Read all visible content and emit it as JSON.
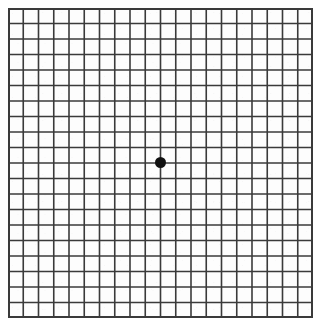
{
  "page": {
    "chart_name": "amsler-grid"
  },
  "chart_data": {
    "type": "table",
    "subtitle": "",
    "xlabel": "",
    "ylabel": "",
    "grid": true,
    "legend_position": "none",
    "columns": 20,
    "rows": 20,
    "cell_size_px": 15.25,
    "categories": [
      "c1",
      "c2",
      "c3",
      "c4",
      "c5",
      "c6",
      "c7",
      "c8",
      "c9",
      "c10",
      "c11",
      "c12",
      "c13",
      "c14",
      "c15",
      "c16",
      "c17",
      "c18",
      "c19",
      "c20"
    ],
    "values": [
      20,
      20,
      20,
      20,
      20,
      20,
      20,
      20,
      20,
      20,
      20,
      20,
      20,
      20,
      20,
      20,
      20,
      20,
      20,
      20
    ],
    "xlim": [
      0,
      20
    ],
    "ylim": [
      0,
      20
    ],
    "annotations": [
      {
        "name": "central-fixation-dot",
        "shape": "filled-circle",
        "x": 10,
        "y": 10,
        "diameter_px": 11
      }
    ]
  },
  "grid": {
    "line_color": "#3a3a3a",
    "line_width_px": 1.6,
    "border_width_px": 2.0,
    "background_color": "#fdfdfd",
    "columns": 20,
    "rows": 20,
    "origin_x_px": 8,
    "origin_y_px": 8,
    "width_px": 305,
    "height_px": 310
  },
  "fixation_dot": {
    "name": "central-fixation-dot",
    "color": "#111111",
    "center_x_px": 160,
    "center_y_px": 162,
    "diameter_px": 11
  },
  "colors": {
    "page_background": "#ffffff",
    "grid_line": "#3a3a3a",
    "dot": "#111111"
  }
}
